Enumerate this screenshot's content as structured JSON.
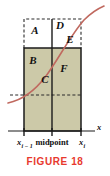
{
  "figure": {
    "caption": "FIGURE 18",
    "caption_color": "#e8392e",
    "curve_color": "#c0695f",
    "fill_color": "#ccc9a8",
    "stroke_color": "#1b1b1b",
    "background": "#ffffff"
  },
  "regions": [
    {
      "id": "A",
      "label": "A",
      "x": 35,
      "y": 34,
      "filled": false
    },
    {
      "id": "B",
      "label": "B",
      "x": 33,
      "y": 64,
      "filled": true
    },
    {
      "id": "C",
      "label": "C",
      "x": 45,
      "y": 83,
      "filled": true
    },
    {
      "id": "D",
      "label": "D",
      "x": 60,
      "y": 29,
      "filled": false
    },
    {
      "id": "E",
      "label": "E",
      "x": 70,
      "y": 42,
      "filled": false
    },
    {
      "id": "F",
      "label": "F",
      "x": 64,
      "y": 72,
      "filled": true
    }
  ],
  "axis": {
    "x_axis_label": "x",
    "left_tick_label": "x",
    "left_tick_subscript": "i − 1",
    "center_tick_label": "midpoint",
    "right_tick_label": "x",
    "right_tick_subscript": "i"
  },
  "geometry": {
    "rect_left": 24,
    "rect_right": 81,
    "rect_mid": 52,
    "rect_top_solid": 48,
    "rect_top_dashed": 19,
    "rect_bottom": 131,
    "dashed_horizontal_y": 95,
    "axis_y": 131
  }
}
